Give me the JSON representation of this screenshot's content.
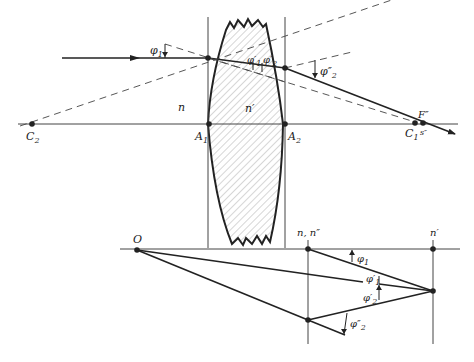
{
  "diagram": {
    "top_figure": {
      "points": {
        "C2": "C",
        "C2_sub": "2",
        "A1": "A",
        "A1_sub": "1",
        "A2": "A",
        "A2_sub": "2",
        "C1": "C",
        "C1_sub": "1",
        "F": "F″",
        "s": "s″"
      },
      "media": {
        "n_left": "n",
        "n_lens": "n′"
      },
      "angles": {
        "phi1": "φ",
        "phi1_sub": "1",
        "phi1p": "φ′",
        "phi1p_sub": "1",
        "phi2p": "φ′",
        "phi2p_sub": "2",
        "phi2pp": "φ″",
        "phi2pp_sub": "2"
      }
    },
    "bottom_figure": {
      "points": {
        "O": "O",
        "n_npp": "n, n″",
        "n_prime": "n′"
      },
      "angles": {
        "phi1": "φ",
        "phi1_sub": "1",
        "phi1p": "φ′",
        "phi1p_sub": "1",
        "phi2p": "φ′",
        "phi2p_sub": "2",
        "phi2pp": "φ″",
        "phi2pp_sub": "2"
      }
    },
    "colors": {
      "ink": "#222222",
      "hatch": "#888888"
    }
  }
}
